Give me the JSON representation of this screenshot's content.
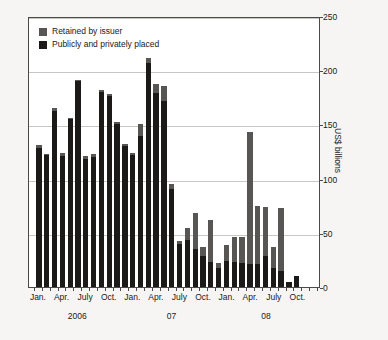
{
  "chart_data": {
    "type": "bar",
    "title": "",
    "subtitle": "",
    "xlabel": "",
    "ylabel": "US$ billions",
    "ylim": [
      0,
      250
    ],
    "yticks": [
      0,
      50,
      100,
      150,
      200,
      250
    ],
    "grid": true,
    "stacked": true,
    "legend_position": "top-left",
    "colors": {
      "retained": "#585654",
      "placed": "#1b1a19",
      "plot_background": "#ffffff",
      "page_background": "#f6f5f3",
      "gridline": "#c9c7c4",
      "axis": "#4a4a4a",
      "text": "#1b1a19"
    },
    "x_tick_labels": [
      {
        "index": 0,
        "label": "Jan."
      },
      {
        "index": 3,
        "label": "Apr."
      },
      {
        "index": 6,
        "label": "July"
      },
      {
        "index": 9,
        "label": "Oct."
      },
      {
        "index": 12,
        "label": "Jan."
      },
      {
        "index": 15,
        "label": "Apr."
      },
      {
        "index": 18,
        "label": "July"
      },
      {
        "index": 21,
        "label": "Oct."
      },
      {
        "index": 24,
        "label": "Jan."
      },
      {
        "index": 27,
        "label": "Apr."
      },
      {
        "index": 30,
        "label": "July"
      },
      {
        "index": 33,
        "label": "Oct."
      }
    ],
    "x_group_labels": [
      {
        "center_index": 5,
        "label": "2006"
      },
      {
        "center_index": 17,
        "label": "07"
      },
      {
        "center_index": 29,
        "label": "08"
      }
    ],
    "categories": [
      "Jan. 2006",
      "Feb. 2006",
      "Mar. 2006",
      "Apr. 2006",
      "May 2006",
      "June 2006",
      "July 2006",
      "Aug. 2006",
      "Sept. 2006",
      "Oct. 2006",
      "Nov. 2006",
      "Dec. 2006",
      "Jan. 07",
      "Feb. 07",
      "Mar. 07",
      "Apr. 07",
      "May 07",
      "June 07",
      "July 07",
      "Aug. 07",
      "Sept. 07",
      "Oct. 07",
      "Nov. 07",
      "Dec. 07",
      "Jan. 08",
      "Feb. 08",
      "Mar. 08",
      "Apr. 08",
      "May 08",
      "June 08",
      "July 08",
      "Aug. 08",
      "Sept. 08",
      "Oct. 08",
      "Nov. 08",
      "Dec. 08"
    ],
    "series": [
      {
        "name": "Publicly and privately placed",
        "color": "#1b1a19",
        "values": [
          128,
          122,
          162,
          121,
          155,
          190,
          118,
          120,
          180,
          176,
          150,
          130,
          122,
          139,
          207,
          179,
          172,
          90,
          40,
          43,
          35,
          29,
          23,
          18,
          24,
          23,
          22,
          21,
          21,
          29,
          18,
          15,
          5,
          10,
          0,
          0
        ]
      },
      {
        "name": "Retained by issuer",
        "color": "#585654",
        "values": [
          3,
          1,
          3,
          3,
          1,
          1,
          3,
          3,
          2,
          2,
          2,
          2,
          2,
          11,
          4,
          8,
          13,
          5,
          2,
          11,
          33,
          8,
          39,
          4,
          15,
          23,
          24,
          122,
          54,
          45,
          19,
          58,
          0,
          0,
          0,
          0
        ]
      }
    ],
    "totals": [
      131,
      123,
      165,
      124,
      156,
      191,
      121,
      123,
      182,
      178,
      152,
      132,
      124,
      150,
      211,
      187,
      185,
      95,
      42,
      54,
      68,
      37,
      62,
      22,
      39,
      46,
      46,
      143,
      75,
      74,
      37,
      73,
      5,
      10,
      0,
      0
    ]
  },
  "legend": {
    "items": [
      {
        "label": "Retained by issuer",
        "key": "retained"
      },
      {
        "label": "Publicly and privately placed",
        "key": "placed"
      }
    ]
  }
}
